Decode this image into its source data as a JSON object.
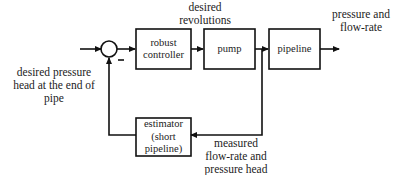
{
  "diagram": {
    "type": "block-diagram",
    "input_label": "desired pressure head at the end of pipe",
    "input_label_lines": [
      "desired pressure",
      "head at the end of",
      "pipe"
    ],
    "sum_sign": "–",
    "blocks": [
      {
        "id": "robust-controller",
        "lines": [
          "robust",
          "controller"
        ]
      },
      {
        "id": "pump",
        "lines": [
          "pump"
        ]
      },
      {
        "id": "pipeline",
        "lines": [
          "pipeline"
        ]
      },
      {
        "id": "estimator",
        "lines": [
          "estimator",
          "(short",
          "pipeline)"
        ]
      }
    ],
    "signals": {
      "controller_to_pump": [
        "desired",
        "revolutions"
      ],
      "output": [
        "pressure and",
        "flow-rate"
      ],
      "feedback": [
        "measured",
        "flow-rate and",
        "pressure head"
      ]
    },
    "colors": {
      "line": "#111111",
      "background": "#ffffff"
    }
  }
}
